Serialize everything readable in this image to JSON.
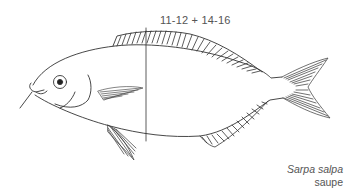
{
  "diagram": {
    "fin_ray_count": "11-12 + 14-16",
    "species": {
      "latin_name": "Sarpa salpa",
      "common_name": "saupe"
    },
    "colors": {
      "line": "#333333",
      "text": "#555555",
      "background": "#ffffff"
    },
    "elements": [
      "head",
      "eye",
      "mouth",
      "dorsal-fin",
      "pectoral-fin",
      "pelvic-fin",
      "anal-fin",
      "caudal-fin",
      "measurement-line"
    ]
  }
}
